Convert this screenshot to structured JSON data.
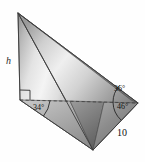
{
  "figure": {
    "kind": "3d-geometry-diagram",
    "background_color": "#ffffff",
    "outline_color": "#3a3a3a",
    "dashed_line_color": "#4a4a4a",
    "shading": {
      "style": "metallic-grayscale-gradient",
      "highlight_color": "#f2f2f2",
      "midtone_color": "#b8b8b8",
      "shadow_color": "#6e6e6e",
      "deep_shadow_color": "#565656"
    },
    "vertices": {
      "apex": {
        "x": 18,
        "y": 13,
        "name": "apex-vertex"
      },
      "base_left": {
        "x": 20,
        "y": 100,
        "name": "base-left-vertex"
      },
      "base_right": {
        "x": 138,
        "y": 103,
        "name": "base-right-vertex"
      },
      "front_bottom": {
        "x": 93,
        "y": 150,
        "name": "front-bottom-vertex"
      }
    },
    "labels": {
      "height": "h",
      "angle_base_left": "34°",
      "angle_upper_right": "36°",
      "angle_lower_right": "46°",
      "edge_length": "10"
    },
    "markers": {
      "right_angle": "right-angle-square-at-base-left",
      "arc_base_left": "angle-arc-34",
      "arc_upper_right": "angle-arc-36",
      "arc_lower_right": "angle-arc-46"
    }
  }
}
